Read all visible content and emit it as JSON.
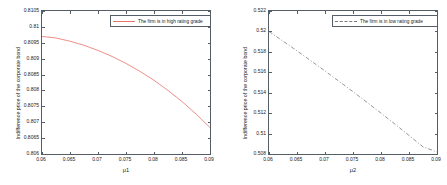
{
  "figure": {
    "panels": [
      {
        "id": "high-rating-panel",
        "ylabel": "Indifference price of the corporate bond",
        "xlabel": "μ1",
        "legend_label": "The firm is in high rating grade",
        "line_color": "#e8736a",
        "line_style": "solid",
        "yticks": [
          "0.806",
          "0.8065",
          "0.807",
          "0.8075",
          "0.808",
          "0.8085",
          "0.809",
          "0.8095",
          "0.81",
          "0.8105"
        ],
        "xticks": [
          "0.06",
          "0.065",
          "0.07",
          "0.075",
          "0.08",
          "0.085",
          "0.09"
        ]
      },
      {
        "id": "low-rating-panel",
        "ylabel": "Indifference price of the corporate bond",
        "xlabel": "μ2",
        "legend_label": "The firm is in low rating grade",
        "line_color": "#7a7a7a",
        "line_style": "dashdot",
        "yticks": [
          "0.508",
          "0.51",
          "0.512",
          "0.514",
          "0.516",
          "0.518",
          "0.52",
          "0.522"
        ],
        "xticks": [
          "0.06",
          "0.065",
          "0.07",
          "0.075",
          "0.08",
          "0.085",
          "0.09"
        ]
      }
    ]
  },
  "chart_data": [
    {
      "type": "line",
      "title": "",
      "xlabel": "μ1",
      "ylabel": "Indifference price of the corporate bond",
      "xlim": [
        0.06,
        0.09
      ],
      "ylim": [
        0.806,
        0.8105
      ],
      "grid": false,
      "legend_position": "top-right",
      "xticks": [
        0.06,
        0.065,
        0.07,
        0.075,
        0.08,
        0.085,
        0.09
      ],
      "yticks": [
        0.806,
        0.8065,
        0.807,
        0.8075,
        0.808,
        0.8085,
        0.809,
        0.8095,
        0.81,
        0.8105
      ],
      "series": [
        {
          "name": "The firm is in high rating grade",
          "color": "#e8736a",
          "style": "solid",
          "x": [
            0.06,
            0.0625,
            0.065,
            0.0675,
            0.07,
            0.0725,
            0.075,
            0.0775,
            0.08,
            0.0825,
            0.085,
            0.0875,
            0.09
          ],
          "y": [
            0.8097,
            0.80965,
            0.80955,
            0.80942,
            0.80926,
            0.80907,
            0.80885,
            0.8086,
            0.80832,
            0.808,
            0.80765,
            0.80726,
            0.80683
          ]
        }
      ]
    },
    {
      "type": "line",
      "title": "",
      "xlabel": "μ2",
      "ylabel": "Indifference price of the corporate bond",
      "xlim": [
        0.06,
        0.09
      ],
      "ylim": [
        0.508,
        0.522
      ],
      "grid": false,
      "legend_position": "top-right",
      "xticks": [
        0.06,
        0.065,
        0.07,
        0.075,
        0.08,
        0.085,
        0.09
      ],
      "yticks": [
        0.508,
        0.51,
        0.512,
        0.514,
        0.516,
        0.518,
        0.52,
        0.522
      ],
      "series": [
        {
          "name": "The firm is in low rating grade",
          "color": "#7a7a7a",
          "style": "dashdot",
          "x": [
            0.06,
            0.0625,
            0.065,
            0.0675,
            0.07,
            0.0725,
            0.075,
            0.0775,
            0.08,
            0.0825,
            0.085,
            0.0875,
            0.09
          ],
          "y": [
            0.52,
            0.51905,
            0.5181,
            0.51712,
            0.51613,
            0.51512,
            0.5141,
            0.51306,
            0.512,
            0.51092,
            0.50982,
            0.5087,
            0.5082
          ]
        }
      ]
    }
  ]
}
